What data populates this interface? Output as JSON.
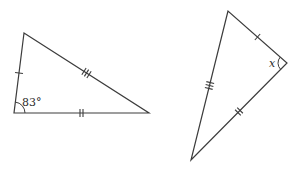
{
  "figure": {
    "background_color": "#ffffff",
    "stroke_color": "#3c3c3c",
    "label_color": "#2a2a2a",
    "triangles": [
      {
        "id": "left-triangle",
        "vertices": [
          [
            24,
            33
          ],
          [
            14,
            113
          ],
          [
            149,
            113
          ]
        ],
        "sides": [
          {
            "from": 0,
            "to": 1,
            "ticks": 1
          },
          {
            "from": 1,
            "to": 2,
            "ticks": 2
          },
          {
            "from": 0,
            "to": 2,
            "ticks": 3
          }
        ],
        "angle": {
          "vertex": 1,
          "label": "83°",
          "arc_radius": 11
        }
      },
      {
        "id": "right-triangle",
        "vertices": [
          [
            228,
            11
          ],
          [
            191,
            160
          ],
          [
            287,
            63
          ]
        ],
        "sides": [
          {
            "from": 0,
            "to": 1,
            "ticks": 3
          },
          {
            "from": 1,
            "to": 2,
            "ticks": 2
          },
          {
            "from": 0,
            "to": 2,
            "ticks": 1
          }
        ],
        "angle": {
          "vertex": 2,
          "label": "x",
          "arc_radius": 9
        }
      }
    ]
  }
}
